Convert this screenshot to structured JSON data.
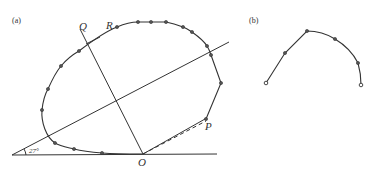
{
  "panel_a": {
    "label": "(a)",
    "points": {
      "Q": "Q",
      "R": "R",
      "P": "P",
      "O": "O"
    },
    "angle_label": "27°",
    "curve_points": [
      [
        102,
        153
      ],
      [
        74,
        149
      ],
      [
        55,
        143
      ],
      [
        42,
        110
      ],
      [
        48,
        89
      ],
      [
        61,
        66
      ],
      [
        79,
        51
      ],
      [
        117,
        27
      ],
      [
        138,
        22
      ],
      [
        151,
        22
      ],
      [
        166,
        22
      ],
      [
        183,
        27
      ],
      [
        192,
        32
      ],
      [
        207,
        46
      ],
      [
        211,
        55
      ],
      [
        221,
        83
      ],
      [
        206,
        119
      ]
    ]
  },
  "panel_b": {
    "label": "(b)",
    "curve_points": [
      [
        266,
        83
      ],
      [
        285,
        53
      ],
      [
        307,
        31
      ],
      [
        335,
        39
      ],
      [
        358,
        63
      ],
      [
        361,
        85
      ]
    ]
  }
}
